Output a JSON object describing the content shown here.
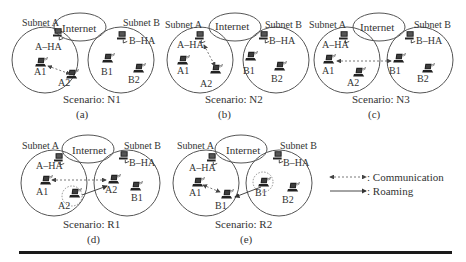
{
  "figure": {
    "panels": [
      {
        "id": "a",
        "caption": "(a)",
        "scenario": "Scenario: N1",
        "internet_label": "Internet",
        "subnet_a_label": "Subnet A",
        "subnet_b_label": "Subnet B",
        "ha_a_label": "A–HA",
        "ha_b_label": "B–HA",
        "nodes_a": [
          "A1",
          "A2"
        ],
        "nodes_b": [
          "B1",
          "B2"
        ],
        "communication": "A1 ↔ A2 (within Subnet A)",
        "roaming": "none"
      },
      {
        "id": "b",
        "caption": "(b)",
        "scenario": "Scenario: N2",
        "internet_label": "Internet",
        "subnet_a_label": "Subnet A",
        "subnet_b_label": "Subnet B",
        "ha_a_label": "A–HA",
        "ha_b_label": "B–HA",
        "nodes_a": [
          "A1",
          "A2"
        ],
        "nodes_b": [
          "B1",
          "B2"
        ],
        "communication": "A–HA ↔ A2",
        "roaming": "none"
      },
      {
        "id": "c",
        "caption": "(c)",
        "scenario": "Scenario: N3",
        "internet_label": "Internet",
        "subnet_a_label": "Subnet A",
        "subnet_b_label": "Subnet B",
        "ha_a_label": "A–HA",
        "ha_b_label": "B–HA",
        "nodes_a": [
          "A1",
          "A2"
        ],
        "nodes_b": [
          "B1",
          "B2"
        ],
        "communication": "A1 ↔ B1 (across subnets)",
        "roaming": "none"
      },
      {
        "id": "d",
        "caption": "(d)",
        "scenario": "Scenario: R1",
        "internet_label": "Internet",
        "subnet_a_label": "Subnet A",
        "subnet_b_label": "Subnet B",
        "ha_a_label": "A–HA",
        "ha_b_label": "B–HA",
        "nodes_a": [
          "A1",
          "A2"
        ],
        "nodes_b": [
          "A2",
          "B1"
        ],
        "communication": "A1 ↔ A2 (roamed)",
        "roaming": "A2: Subnet A → Subnet B"
      },
      {
        "id": "e",
        "caption": "(e)",
        "scenario": "Scenario: R2",
        "internet_label": "Internet",
        "subnet_a_label": "Subnet A",
        "subnet_b_label": "Subnet B",
        "ha_a_label": "A–HA",
        "ha_b_label": "B–HA",
        "nodes_a": [
          "A1",
          "B1"
        ],
        "nodes_b": [
          "B1",
          "B2"
        ],
        "communication": "A1 ↔ B1 (roamed)",
        "roaming": "B1: Subnet B → Subnet A"
      }
    ],
    "legend": {
      "communication": ": Communication",
      "roaming": ": Roaming"
    }
  }
}
